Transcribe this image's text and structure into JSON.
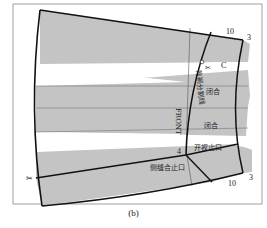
{
  "figure": {
    "caption": "(b)",
    "colors": {
      "fill": "#c4c4c4",
      "outline": "#111111",
      "thin_line": "#555555",
      "frame": "#888888"
    },
    "labels": {
      "split_line": "背裥分割线",
      "front": "FRONT",
      "closed_1": "闭合",
      "closed_2": "闭合",
      "slit_stop": "开衩止口",
      "side_seam_stop": "侧缝合止口"
    },
    "numbers": {
      "top_10": "10",
      "top_3": "3",
      "bottom_10": "10",
      "bottom_3": "3",
      "point_4": "4"
    }
  }
}
